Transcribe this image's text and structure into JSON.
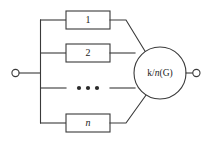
{
  "diagram": {
    "type": "reliability-block-diagram",
    "stroke_color": "#3a3a3a",
    "text_color": "#222222",
    "background_color": "#ffffff",
    "blocks": [
      {
        "id": "block-1",
        "label": "1",
        "italic": false
      },
      {
        "id": "block-2",
        "label": "2",
        "italic": false
      },
      {
        "id": "block-n",
        "label": "n",
        "italic": true
      }
    ],
    "ellipsis": {
      "label": "• • •",
      "dot_count": 3
    },
    "gate": {
      "id": "gate-k-of-n",
      "label_prefix": "k/",
      "label_italic": "n",
      "label_suffix": "(G)",
      "label_full": "k/n(G)"
    },
    "terminals": [
      {
        "id": "terminal-input",
        "position": "left"
      },
      {
        "id": "terminal-output",
        "position": "right"
      }
    ]
  }
}
